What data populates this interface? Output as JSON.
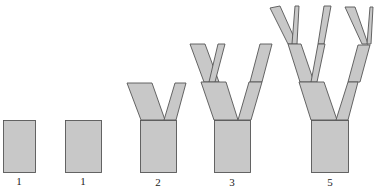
{
  "colors": {
    "fill": "#c8c8c8",
    "stroke": "#555555",
    "label": "#222222"
  },
  "stages": [
    {
      "id": "stage-1a",
      "label": "1",
      "branch_levels": 0
    },
    {
      "id": "stage-1b",
      "label": "1",
      "branch_levels": 0
    },
    {
      "id": "stage-2",
      "label": "2",
      "branch_levels": 1
    },
    {
      "id": "stage-3",
      "label": "3",
      "branch_levels": 2
    },
    {
      "id": "stage-5",
      "label": "5",
      "branch_levels": 3
    }
  ]
}
